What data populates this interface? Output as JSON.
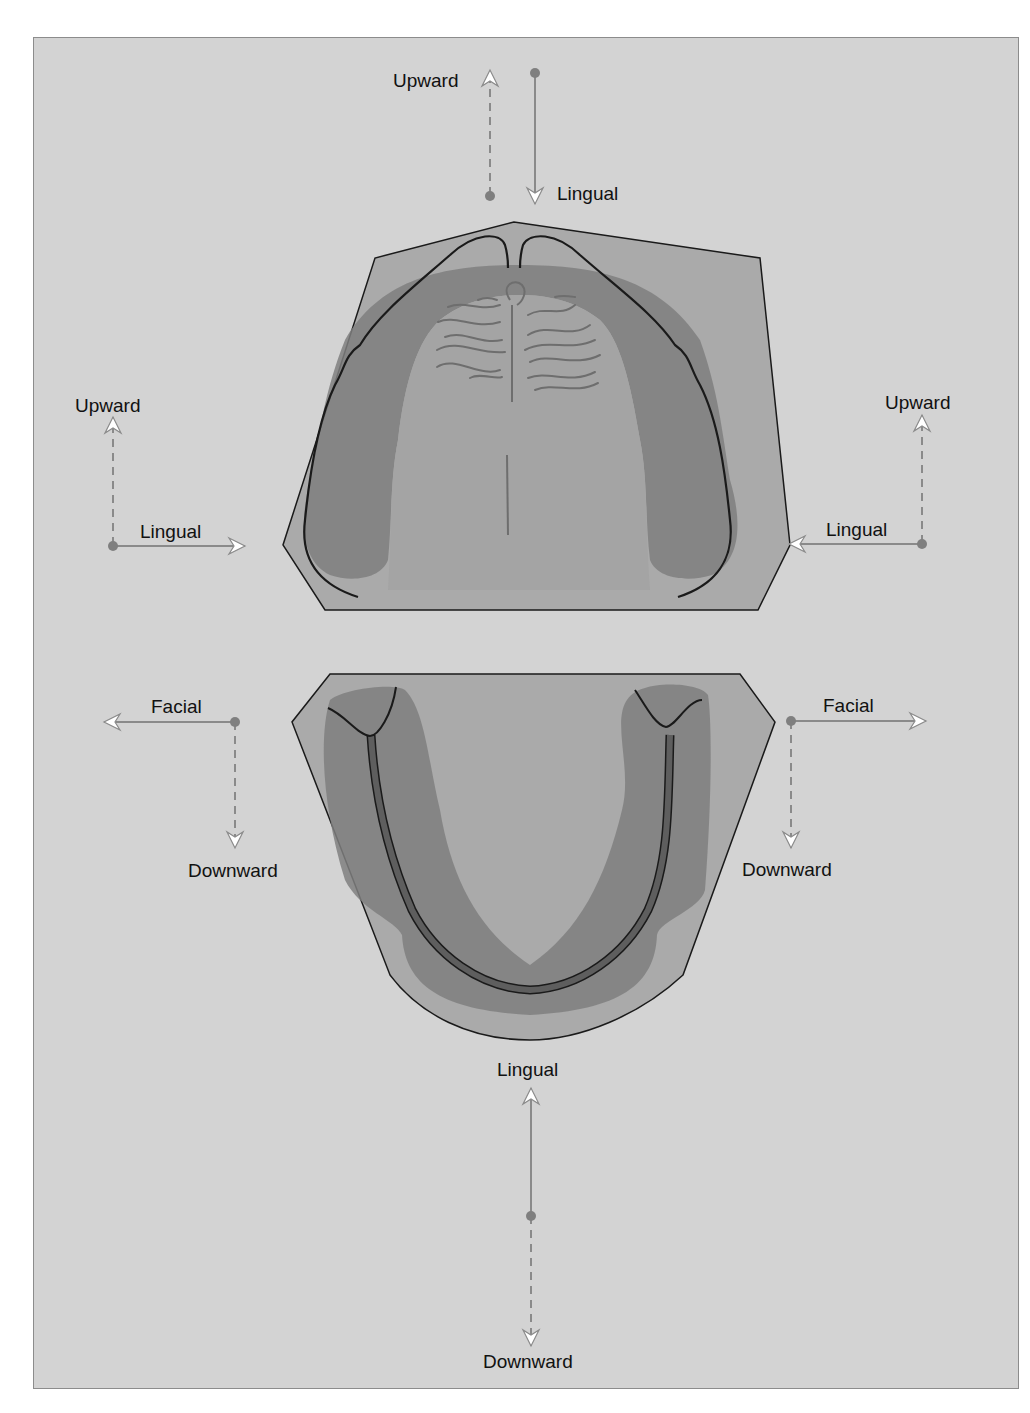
{
  "figure": {
    "colors": {
      "background": "#d3d3d3",
      "frame_border": "#8c8c8c",
      "base_fill": "#a9a9a9",
      "palate_fill": "#a0a0a0",
      "ridge_dark": "#7c7c7c",
      "ridge_mid": "#8d8d8d",
      "outline": "#1a1a1a",
      "arrow_line": "#8a8a8a",
      "arrow_head_fill": "#ffffff",
      "dot": "#7f7f7f"
    },
    "upper_arch": {
      "name": "Maxillary cast",
      "arrows": {
        "top": {
          "dashed_label": "Upward",
          "solid_label": "Lingual"
        },
        "left": {
          "dashed_label": "Upward",
          "solid_label": "Lingual"
        },
        "right": {
          "dashed_label": "Upward",
          "solid_label": "Lingual"
        }
      }
    },
    "lower_arch": {
      "name": "Mandibular cast",
      "arrows": {
        "left": {
          "solid_label": "Facial",
          "dashed_label": "Downward"
        },
        "right": {
          "solid_label": "Facial",
          "dashed_label": "Downward"
        },
        "bottom": {
          "solid_label": "Lingual",
          "dashed_label": "Downward"
        }
      }
    }
  }
}
